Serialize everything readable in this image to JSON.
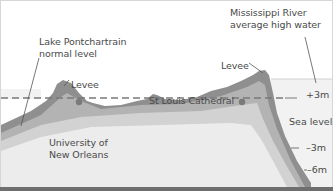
{
  "diagram": {
    "type": "cross-section",
    "labels": {
      "lake": "Lake Pontchartrain\nnormal level",
      "lake_line1": "Lake Pontchartrain",
      "lake_line2": "normal level",
      "river_line1": "Mississippi River",
      "river_line2": "average high water",
      "levee_left": "Levee",
      "levee_right": "Levee",
      "university_line1": "University of",
      "university_line2": "New Orleans",
      "cathedral": "St Louis Cathedral"
    },
    "scale": {
      "plus3": "+3m",
      "sea_level": "Sea level",
      "minus3": "–3m",
      "minus6": "–6m"
    },
    "colors": {
      "ground_dark": "#8e8e8e",
      "ground_mid": "#b4b4b4",
      "ground_light": "#d4d4d4",
      "ground_pale": "#ececec",
      "water": "#f0f0f0",
      "sea_level_line": "#777777",
      "marker": "#7a7a7a",
      "text": "#4a4a4a"
    }
  }
}
